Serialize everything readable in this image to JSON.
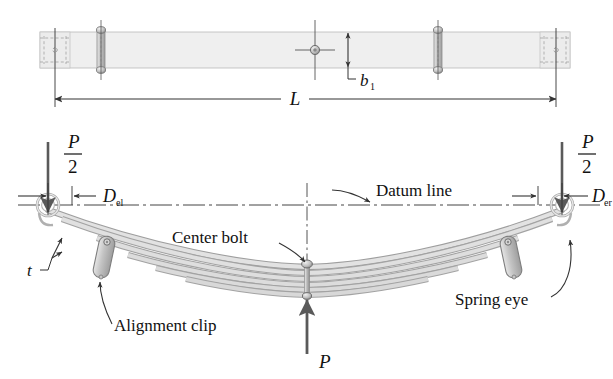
{
  "figure": {
    "kind": "leaf-spring-engineering-drawing",
    "views": [
      "top-view",
      "side-view"
    ]
  },
  "colors": {
    "line": "#333333",
    "leaf_fill": "#d9d9d9",
    "plate_fill": "#efefef",
    "clip_fill": "#c9c9c9",
    "arrow_fill": "#5a5a5a",
    "text": "#111111",
    "centerline": "#444444"
  },
  "top_view": {
    "dimension_L": "L",
    "dimension_b1_base": "b",
    "dimension_b1_sub": "1",
    "plate": {
      "x": 40,
      "y": 32,
      "width": 530,
      "height": 35
    },
    "bolt_positions": [
      101,
      315,
      438
    ],
    "eye_dash_positions": [
      55,
      556
    ]
  },
  "side_view": {
    "load_left": {
      "num": "P",
      "den": "2"
    },
    "load_right": {
      "num": "P",
      "den": "2"
    },
    "load_center": "P",
    "dim_left_base": "D",
    "dim_left_sub": "el",
    "dim_right_base": "D",
    "dim_right_sub": "er",
    "thickness_label": "t",
    "callouts": [
      {
        "name": "datum-line",
        "text": "Datum line"
      },
      {
        "name": "center-bolt",
        "text": "Center bolt"
      },
      {
        "name": "spring-eye",
        "text": "Spring eye"
      },
      {
        "name": "alignment-clip",
        "text": "Alignment clip"
      }
    ],
    "leaf_count": 6,
    "eye_left_x": 48,
    "eye_right_x": 562,
    "datum_y": 205,
    "center_x": 307
  }
}
